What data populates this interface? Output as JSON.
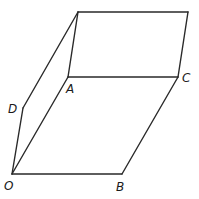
{
  "diagram": {
    "type": "geometric-solid",
    "stroke_color": "#2a2a2a",
    "points": {
      "O": {
        "x": 12,
        "y": 174,
        "label": "O",
        "label_x": 4,
        "label_y": 190
      },
      "B": {
        "x": 122,
        "y": 174,
        "label": "B",
        "label_x": 116,
        "label_y": 191
      },
      "C": {
        "x": 178,
        "y": 77,
        "label": "C",
        "label_x": 182,
        "label_y": 82
      },
      "A": {
        "x": 68,
        "y": 77,
        "label": "A",
        "label_x": 66,
        "label_y": 93
      },
      "D": {
        "x": 23,
        "y": 108,
        "label": "D",
        "label_x": 8,
        "label_y": 113
      },
      "E": {
        "x": 78,
        "y": 12,
        "label": ""
      },
      "F": {
        "x": 188,
        "y": 12,
        "label": ""
      }
    },
    "edges": [
      [
        "O",
        "B"
      ],
      [
        "B",
        "C"
      ],
      [
        "C",
        "A"
      ],
      [
        "A",
        "O"
      ],
      [
        "O",
        "D"
      ],
      [
        "D",
        "E"
      ],
      [
        "E",
        "A"
      ],
      [
        "E",
        "F"
      ],
      [
        "F",
        "C"
      ]
    ]
  }
}
